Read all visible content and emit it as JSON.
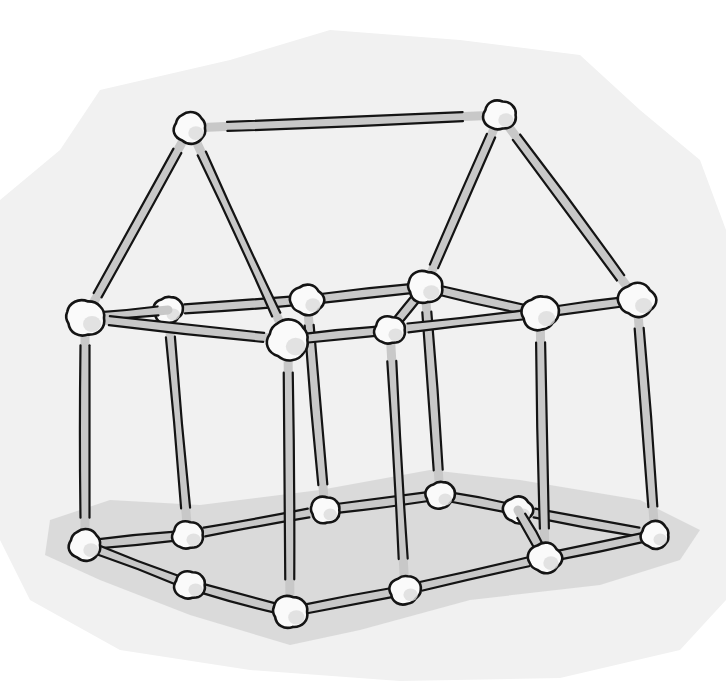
{
  "illustration": {
    "subject": "house-frame-from-sticks-and-marshmallows",
    "width": 726,
    "height": 681,
    "colors": {
      "page_background": "#ffffff",
      "backdrop": "#f1f1f1",
      "ground_shadow": "#d6d6d6",
      "stick": "#c8c8c8",
      "outline": "#141414",
      "node": "#fafafa",
      "node_shade": "#dcdcdc"
    },
    "backdrop_polygon": [
      [
        60,
        150
      ],
      [
        100,
        90
      ],
      [
        230,
        60
      ],
      [
        330,
        30
      ],
      [
        460,
        40
      ],
      [
        580,
        55
      ],
      [
        640,
        110
      ],
      [
        700,
        160
      ],
      [
        726,
        230
      ],
      [
        726,
        600
      ],
      [
        680,
        650
      ],
      [
        560,
        678
      ],
      [
        400,
        681
      ],
      [
        250,
        670
      ],
      [
        120,
        650
      ],
      [
        30,
        600
      ],
      [
        0,
        540
      ],
      [
        0,
        200
      ]
    ],
    "shadow_polygon": [
      [
        50,
        520
      ],
      [
        110,
        500
      ],
      [
        200,
        505
      ],
      [
        320,
        490
      ],
      [
        430,
        470
      ],
      [
        520,
        480
      ],
      [
        640,
        500
      ],
      [
        700,
        530
      ],
      [
        680,
        560
      ],
      [
        600,
        585
      ],
      [
        470,
        600
      ],
      [
        360,
        630
      ],
      [
        290,
        645
      ],
      [
        190,
        615
      ],
      [
        100,
        580
      ],
      [
        45,
        555
      ]
    ],
    "nodes": {
      "A": [
        190,
        128,
        17
      ],
      "B": [
        500,
        115,
        17
      ],
      "C": [
        85,
        318,
        20
      ],
      "D": [
        168,
        310,
        15
      ],
      "E": [
        307,
        300,
        17
      ],
      "F": [
        288,
        340,
        22
      ],
      "G": [
        390,
        330,
        16
      ],
      "H": [
        425,
        287,
        18
      ],
      "I": [
        540,
        313,
        19
      ],
      "J": [
        637,
        300,
        19
      ],
      "K": [
        85,
        545,
        17
      ],
      "L": [
        188,
        535,
        16
      ],
      "M": [
        325,
        510,
        15
      ],
      "N": [
        440,
        495,
        15
      ],
      "O": [
        518,
        510,
        15
      ],
      "P": [
        655,
        535,
        15
      ],
      "Q": [
        190,
        585,
        16
      ],
      "R": [
        290,
        612,
        18
      ],
      "S": [
        405,
        590,
        16
      ],
      "T": [
        545,
        558,
        17
      ]
    },
    "back_sticks": [
      [
        "D",
        "E"
      ],
      [
        "E",
        "H"
      ],
      [
        "D",
        "L"
      ],
      [
        "E",
        "M"
      ],
      [
        "H",
        "N"
      ],
      [
        "L",
        "M"
      ],
      [
        "M",
        "N"
      ],
      [
        "N",
        "O"
      ],
      [
        "L",
        "K"
      ],
      [
        "O",
        "P"
      ]
    ],
    "front_sticks": [
      [
        "A",
        "B"
      ],
      [
        "A",
        "C"
      ],
      [
        "A",
        "F"
      ],
      [
        "B",
        "H"
      ],
      [
        "B",
        "J"
      ],
      [
        "C",
        "D"
      ],
      [
        "C",
        "F"
      ],
      [
        "F",
        "G"
      ],
      [
        "G",
        "H"
      ],
      [
        "H",
        "I"
      ],
      [
        "I",
        "J"
      ],
      [
        "G",
        "I"
      ],
      [
        "C",
        "K"
      ],
      [
        "F",
        "R"
      ],
      [
        "G",
        "S"
      ],
      [
        "I",
        "T"
      ],
      [
        "J",
        "P"
      ],
      [
        "K",
        "Q"
      ],
      [
        "Q",
        "R"
      ],
      [
        "R",
        "S"
      ],
      [
        "S",
        "T"
      ],
      [
        "T",
        "P"
      ],
      [
        "O",
        "T"
      ]
    ]
  }
}
